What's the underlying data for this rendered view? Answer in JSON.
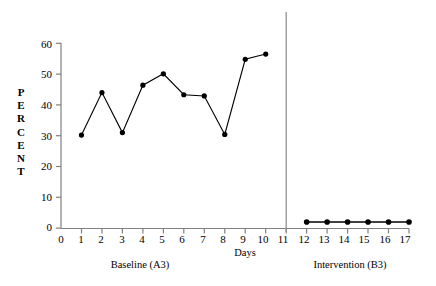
{
  "chart_data": {
    "type": "line",
    "title": "",
    "xlabel": "Days",
    "ylabel": "PERCENT",
    "xlim": [
      0,
      17
    ],
    "ylim": [
      0,
      60
    ],
    "grid": false,
    "legend": "none",
    "x_ticks": [
      "0",
      "1",
      "2",
      "3",
      "4",
      "5",
      "6",
      "7",
      "8",
      "9",
      "10",
      "11",
      "12",
      "13",
      "14",
      "15",
      "16",
      "17"
    ],
    "y_ticks": [
      "0",
      "10",
      "20",
      "30",
      "40",
      "50",
      "60"
    ],
    "annotations": [
      {
        "name": "phase-divider",
        "x": 11,
        "label": ""
      }
    ],
    "series": [
      {
        "name": "Baseline (A3)",
        "x": [
          1,
          2,
          3,
          4,
          5,
          6,
          7,
          8,
          9,
          10
        ],
        "values": [
          30.2,
          44.0,
          31.0,
          46.4,
          50.1,
          43.3,
          42.9,
          30.4,
          54.8,
          56.5
        ]
      },
      {
        "name": "Intervention (B3)",
        "x": [
          12,
          13,
          14,
          15,
          16,
          17
        ],
        "values": [
          2.0,
          2.0,
          2.0,
          2.0,
          2.0,
          2.0
        ]
      }
    ]
  },
  "axis": {
    "y_label_letters": [
      "P",
      "E",
      "R",
      "C",
      "E",
      "N",
      "T"
    ],
    "x_axis_title": "Days"
  },
  "phases": {
    "baseline_caption": "Baseline (A3)",
    "intervention_caption": "Intervention (B3)"
  },
  "colors": {
    "axis": "#808080",
    "line": "#000000",
    "marker": "#000000",
    "divider": "#808080",
    "background": "#ffffff"
  }
}
